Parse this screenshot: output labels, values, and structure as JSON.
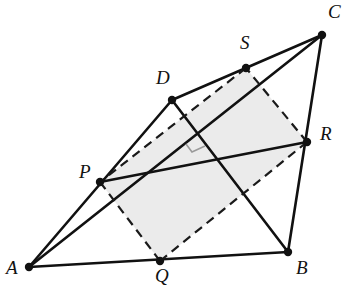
{
  "figure": {
    "canvas": {
      "width": 349,
      "height": 290
    },
    "colors": {
      "background": "#ffffff",
      "stroke": "#111111",
      "dashed_stroke": "#1a1a1a",
      "fill": "#ebebeb",
      "right_angle_mark": "#9a9a9a",
      "label": "#111111"
    },
    "points": [
      {
        "name": "A",
        "x": 29,
        "y": 267,
        "label": "A",
        "label_x": 6,
        "label_y": 258,
        "dot": true
      },
      {
        "name": "B",
        "x": 288,
        "y": 252,
        "label": "B",
        "label_x": 296,
        "label_y": 258,
        "dot": true
      },
      {
        "name": "C",
        "x": 322,
        "y": 35,
        "label": "C",
        "label_x": 328,
        "label_y": 2,
        "dot": true
      },
      {
        "name": "D",
        "x": 172,
        "y": 100,
        "label": "D",
        "label_x": 156,
        "label_y": 68,
        "dot": true
      },
      {
        "name": "P",
        "x": 100,
        "y": 182,
        "label": "P",
        "label_x": 79,
        "label_y": 162,
        "dot": true
      },
      {
        "name": "Q",
        "x": 160,
        "y": 261,
        "label": "Q",
        "label_x": 155,
        "label_y": 266,
        "dot": true
      },
      {
        "name": "R",
        "x": 307,
        "y": 142,
        "label": "R",
        "label_x": 320,
        "label_y": 124,
        "dot": true
      },
      {
        "name": "S",
        "x": 246,
        "y": 68,
        "label": "S",
        "label_x": 240,
        "label_y": 33,
        "dot": true
      }
    ],
    "shaded_region": {
      "name": "quadrilateral-PQRS-fill",
      "vertices": [
        "P",
        "Q",
        "R",
        "S"
      ]
    },
    "solid_segments": [
      {
        "name": "segment-AB",
        "from": "A",
        "to": "B"
      },
      {
        "name": "segment-BC",
        "from": "B",
        "to": "C"
      },
      {
        "name": "segment-AD",
        "from": "A",
        "to": "D"
      },
      {
        "name": "segment-DC",
        "from": "D",
        "to": "C"
      },
      {
        "name": "segment-AC",
        "from": "A",
        "to": "C"
      },
      {
        "name": "segment-DB",
        "from": "D",
        "to": "B"
      },
      {
        "name": "segment-PR",
        "from": "P",
        "to": "R"
      }
    ],
    "dashed_segments": [
      {
        "name": "segment-PQ",
        "from": "P",
        "to": "Q"
      },
      {
        "name": "segment-QR",
        "from": "Q",
        "to": "R"
      },
      {
        "name": "segment-RS",
        "from": "R",
        "to": "S"
      },
      {
        "name": "segment-SP",
        "from": "S",
        "to": "P"
      }
    ],
    "right_angle_mark": {
      "name": "right-angle-mark",
      "at": {
        "x": 196,
        "y": 141
      },
      "points": "186,144 192,152 205,146"
    },
    "style": {
      "solid_stroke_width": 2.6,
      "dashed_stroke_width": 2.2,
      "dash_pattern": "9 6",
      "dot_radius": 4.2,
      "right_angle_stroke_width": 1.6
    }
  }
}
